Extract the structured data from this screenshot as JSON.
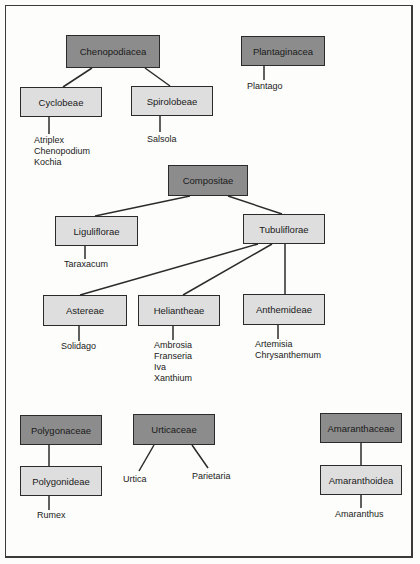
{
  "heading": "Weeds",
  "colors": {
    "family_box": "#8c8c8c",
    "subgroup_box": "#dedede",
    "line": "#2b2b2b"
  },
  "trees": {
    "chenopodiacea": {
      "label": "Chenopodiacea",
      "children": [
        {
          "label": "Cyclobeae",
          "genera": [
            "Atriplex",
            "Chenopodium",
            "Kochia"
          ]
        },
        {
          "label": "Spirolobeae",
          "genera": [
            "Salsola"
          ]
        }
      ]
    },
    "plantaginacea": {
      "label": "Plantaginacea",
      "genera": [
        "Plantago"
      ]
    },
    "compositae": {
      "label": "Compositae",
      "children": [
        {
          "label": "Liguliflorae",
          "genera": [
            "Taraxacum"
          ]
        },
        {
          "label": "Tubuliflorae",
          "children": [
            {
              "label": "Astereae",
              "genera": [
                "Solidago"
              ]
            },
            {
              "label": "Heliantheae",
              "genera": [
                "Ambrosia",
                "Franseria",
                "Iva",
                "Xanthium"
              ]
            },
            {
              "label": "Anthemideae",
              "genera": [
                "Artemisia",
                "Chrysanthemum"
              ]
            }
          ]
        }
      ]
    },
    "polygonaceae": {
      "label": "Polygonaceae",
      "children": [
        {
          "label": "Polygonideae",
          "genera": [
            "Rumex"
          ]
        }
      ]
    },
    "urticaceae": {
      "label": "Urticaceae",
      "genera": [
        "Urtica",
        "Parietaria"
      ]
    },
    "amaranthaceae": {
      "label": "Amaranthaceae",
      "children": [
        {
          "label": "Amaranthoidea",
          "genera": [
            "Amaranthus"
          ]
        }
      ]
    }
  }
}
